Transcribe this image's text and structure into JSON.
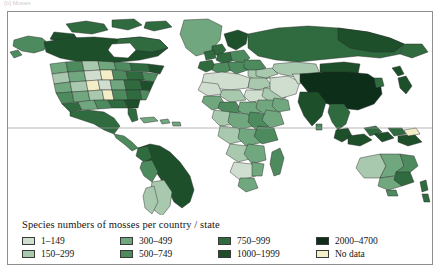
{
  "figure": {
    "caption_remnant": "(b) Mosses",
    "frame_color": "#8e8e8e"
  },
  "map": {
    "name": "world-choropleth-mosses",
    "background": "#ffffff",
    "border_color": "#3a3a3a",
    "equator_line_color": "#9a9a9a",
    "projection_note": "world equirectangular"
  },
  "legend": {
    "title": "Species numbers of mosses per country / state",
    "items": [
      {
        "label": "1–149",
        "color": "#cfdecf"
      },
      {
        "label": "150–299",
        "color": "#a8c9ae"
      },
      {
        "label": "300–499",
        "color": "#71a77e"
      },
      {
        "label": "500–749",
        "color": "#4d8a5d"
      },
      {
        "label": "750–999",
        "color": "#2f6b3f"
      },
      {
        "label": "1000–1999",
        "color": "#1d4f2b"
      },
      {
        "label": "2000–4700",
        "color": "#0d2e18"
      },
      {
        "label": "No data",
        "color": "#f3eec6"
      }
    ],
    "column_order": [
      0,
      2,
      4,
      6,
      1,
      3,
      5,
      7
    ]
  },
  "chart_data": {
    "type": "choropleth",
    "title": "Species numbers of mosses per country / state",
    "unit": "species count",
    "bins": [
      {
        "range": "1–149",
        "min": 1,
        "max": 149,
        "color": "#cfdecf"
      },
      {
        "range": "150–299",
        "min": 150,
        "max": 299,
        "color": "#a8c9ae"
      },
      {
        "range": "300–499",
        "min": 300,
        "max": 499,
        "color": "#71a77e"
      },
      {
        "range": "500–749",
        "min": 500,
        "max": 749,
        "color": "#4d8a5d"
      },
      {
        "range": "750–999",
        "min": 750,
        "max": 999,
        "color": "#2f6b3f"
      },
      {
        "range": "1000–1999",
        "min": 1000,
        "max": 1999,
        "color": "#1d4f2b"
      },
      {
        "range": "2000–4700",
        "min": 2000,
        "max": 4700,
        "color": "#0d2e18"
      },
      {
        "range": "No data",
        "min": null,
        "max": null,
        "color": "#f3eec6"
      }
    ],
    "regions": [
      {
        "name": "Canada",
        "bin": "1000–1999"
      },
      {
        "name": "Alaska",
        "bin": "500–749"
      },
      {
        "name": "Greenland",
        "bin": "300–499"
      },
      {
        "name": "United States",
        "bin": "300–499"
      },
      {
        "name": "Mexico",
        "bin": "750–999"
      },
      {
        "name": "Central America",
        "bin": "500–749"
      },
      {
        "name": "Caribbean",
        "bin": "300–499"
      },
      {
        "name": "Colombia",
        "bin": "1000–1999"
      },
      {
        "name": "Brazil",
        "bin": "1000–1999"
      },
      {
        "name": "Peru",
        "bin": "750–999"
      },
      {
        "name": "Argentina",
        "bin": "150–299"
      },
      {
        "name": "Chile",
        "bin": "500–749"
      },
      {
        "name": "Scandinavia",
        "bin": "1000–1999"
      },
      {
        "name": "Western Europe",
        "bin": "750–999"
      },
      {
        "name": "Iberia",
        "bin": "750–999"
      },
      {
        "name": "Eastern Europe",
        "bin": "500–749"
      },
      {
        "name": "North Africa",
        "bin": "1–149"
      },
      {
        "name": "Sahel",
        "bin": "1–149"
      },
      {
        "name": "East Africa",
        "bin": "300–499"
      },
      {
        "name": "Central Africa",
        "bin": "300–499"
      },
      {
        "name": "Southern Africa",
        "bin": "300–499"
      },
      {
        "name": "Madagascar",
        "bin": "500–749"
      },
      {
        "name": "Arabia",
        "bin": "1–149"
      },
      {
        "name": "Russia",
        "bin": "1000–1999"
      },
      {
        "name": "China",
        "bin": "2000–4700"
      },
      {
        "name": "India",
        "bin": "1000–1999"
      },
      {
        "name": "Japan",
        "bin": "1000–1999"
      },
      {
        "name": "Southeast Asia",
        "bin": "750–999"
      },
      {
        "name": "Indonesia",
        "bin": "1000–1999"
      },
      {
        "name": "New Guinea",
        "bin": "1000–1999"
      },
      {
        "name": "Australia",
        "bin": "300–499"
      },
      {
        "name": "New Zealand",
        "bin": "750–999"
      }
    ]
  }
}
